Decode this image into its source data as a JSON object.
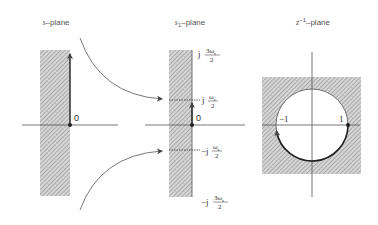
{
  "panels": [
    {
      "id": "s-plane",
      "title_var": "s",
      "title_sub": "",
      "title_sup": "",
      "title_suffix": "–plane",
      "origin_label": "0"
    },
    {
      "id": "s1-plane",
      "title_var": "s",
      "title_sub": "1",
      "title_sup": "",
      "title_suffix": "–plane",
      "origin_label": "0",
      "tick_labels": [
        {
          "prefix": "j",
          "num": "3ω",
          "num_sub": "s",
          "den": "2"
        },
        {
          "prefix": "j",
          "num": "ω",
          "num_sub": "s",
          "den": "2"
        },
        {
          "prefix": "−j",
          "num": "ω",
          "num_sub": "s",
          "den": "2"
        },
        {
          "prefix": "−j",
          "num": "3ω",
          "num_sub": "s",
          "den": "2"
        }
      ]
    },
    {
      "id": "z-inverse-plane",
      "title_var": "z",
      "title_sub": "",
      "title_sup": "−1",
      "title_suffix": "–plane",
      "neg_one_label": "−1",
      "one_label": "1"
    }
  ],
  "colors": {
    "line": "#444444",
    "hatch": "#777777",
    "hatch_bg": "#d8d8d8"
  }
}
